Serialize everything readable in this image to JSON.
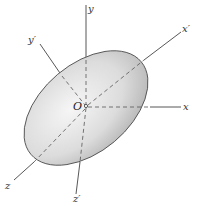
{
  "figure": {
    "origin_label": "O",
    "axes": {
      "x": "x",
      "y": "y",
      "z": "z",
      "x_prime": "x′",
      "y_prime": "y′",
      "z_prime": "z′"
    },
    "colors": {
      "axis_line": "#444444",
      "ellipsoid_edge": "#555555",
      "ellipsoid_light": "#f4f4f4",
      "ellipsoid_dark": "#b8b8b8"
    }
  }
}
